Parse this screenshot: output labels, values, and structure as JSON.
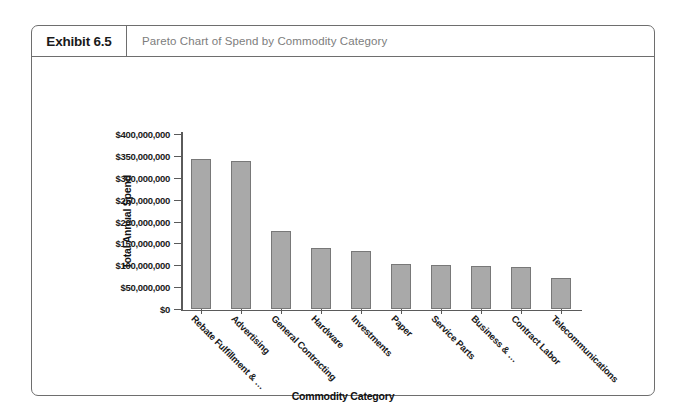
{
  "exhibit": {
    "tag": "Exhibit 6.5",
    "title": "Pareto Chart of Spend by Commodity Category"
  },
  "chart_data": {
    "type": "bar",
    "title": "Pareto Chart of Spend by Commodity Category",
    "xlabel": "Commodity Category",
    "ylabel": "Total Annual Spend",
    "categories": [
      "Rebate Fulfillment & …",
      "Advertising",
      "General Contracting",
      "Hardware",
      "Investments",
      "Paper",
      "Service Parts",
      "Business & …",
      "Contract Labor",
      "Telecommunications"
    ],
    "values": [
      344000000,
      338000000,
      178000000,
      140000000,
      132000000,
      102000000,
      101000000,
      98000000,
      96000000,
      72000000
    ],
    "ylim": [
      0,
      400000000
    ],
    "ytick_values": [
      0,
      50000000,
      100000000,
      150000000,
      200000000,
      250000000,
      300000000,
      350000000,
      400000000
    ],
    "ytick_labels": [
      "$0",
      "$50,000,000",
      "$100,000,000",
      "$150,000,000",
      "$200,000,000",
      "$250,000,000",
      "$300,000,000",
      "$350,000,000",
      "$400,000,000"
    ],
    "grid": false,
    "legend": false,
    "bar_color": "#a9a9a9",
    "bar_border_color": "#787878",
    "axis_color": "#5a5a5a"
  },
  "colors": {
    "frame": "#6e6e6e",
    "title_text": "#7d7d7d",
    "tag_text": "#1a1a1a"
  }
}
